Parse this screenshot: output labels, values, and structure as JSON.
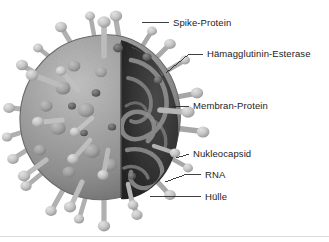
{
  "figure": {
    "kind": "scientific-illustration",
    "language": "de",
    "style": "grayscale halftone print scan",
    "background_color": "#ffffff",
    "baseline_rule_color": "#d8d8d8"
  },
  "palette": {
    "envelope_light": "#b4b4b4",
    "envelope_mid": "#9a9a9a",
    "envelope_dark": "#7d7d7d",
    "envelope_edge": "#6a6a6a",
    "interior_dark": "#383838",
    "interior_darkest": "#232323",
    "nucleocapsid_strand": "#8f8f8f",
    "spike_light": "#d2d2d2",
    "spike_mid": "#bdbdbd",
    "spike_shadow": "#8d8d8d",
    "he_knob": "#6e6e6e",
    "membrane_bump": "#a8a8a8",
    "leader_line": "#2a2a2a",
    "text": "#1c1c1c"
  },
  "labels": [
    {
      "id": "spike-protein",
      "text": "Spike-Protein",
      "leader": "horizontal short line from spike tip to text"
    },
    {
      "id": "haemagglutinin-esterase",
      "text": "Hämagglutinin-Esterase",
      "leader": "diagonal line down-left to envelope surface knob"
    },
    {
      "id": "membran-protein",
      "text": "Membran-Protein",
      "leader": "short horizontal line to envelope membrane"
    },
    {
      "id": "nukleocapsid",
      "text": "Nukleocapsid",
      "leader": "short line to dark interior coil"
    },
    {
      "id": "rna",
      "text": "RNA",
      "leader": "diagonal line down-left to interior strand"
    },
    {
      "id": "huelle",
      "text": "Hülle",
      "leader": "diagonal line down-left to outer envelope edge"
    }
  ],
  "structures": {
    "particle_center": {
      "x": 103,
      "y": 120
    },
    "particle_radius": 84,
    "cutaway_side": "right",
    "spike_count": 26
  }
}
